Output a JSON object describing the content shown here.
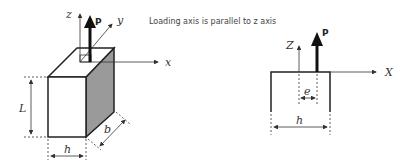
{
  "caption": "Loading axis is parallel to z axis",
  "left_figure": {
    "labels": {
      "z": "z",
      "y": "y",
      "x": "x",
      "P": "P",
      "L": "L",
      "b": "b",
      "h": "h"
    }
  },
  "right_figure": {
    "labels": {
      "z": "Z",
      "x": "X",
      "P": "P",
      "e": "e",
      "h": "h"
    }
  },
  "colors": {
    "line": "#222222",
    "shade": "#9a9a9a",
    "axis": "#333333"
  }
}
